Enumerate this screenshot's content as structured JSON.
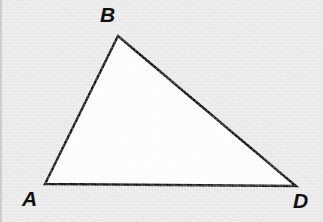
{
  "figure": {
    "name": "triangle-abd-diagram",
    "type": "geometry-diagram",
    "canvas": {
      "width": 323,
      "height": 222
    },
    "background_color": "#ebebeb",
    "shape": {
      "name": "triangle",
      "fill_color": "#ffffff",
      "stroke_color": "#111111",
      "stroke_width": 2.4,
      "points": "45,184 118,36 296,186",
      "vertices": [
        {
          "id": "A",
          "x": 45,
          "y": 184
        },
        {
          "id": "B",
          "x": 118,
          "y": 36
        },
        {
          "id": "D",
          "x": 296,
          "y": 186
        }
      ]
    },
    "labels": [
      {
        "id": "label-a",
        "text": "A",
        "x": 22,
        "y": 188
      },
      {
        "id": "label-b",
        "text": "B",
        "x": 100,
        "y": 4
      },
      {
        "id": "label-d",
        "text": "D",
        "x": 293,
        "y": 190
      }
    ]
  }
}
